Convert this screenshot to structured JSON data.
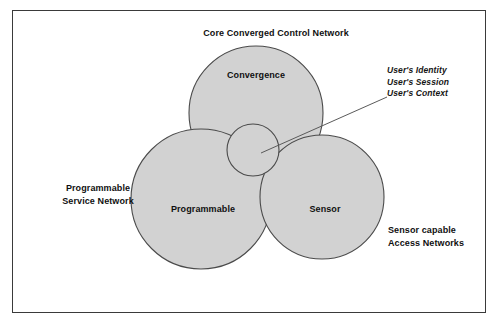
{
  "figure": {
    "frame_color": "#3a3a3a",
    "circle_fill": "#d2d2d2",
    "circle_stroke": "#4a4a4a",
    "background": "#ffffff"
  },
  "diagram": {
    "title_top": "Core Converged Control Network",
    "circles": [
      {
        "id": "convergence",
        "label": "Convergence",
        "cx": 256,
        "cy": 113,
        "r": 67
      },
      {
        "id": "programmable",
        "label": "Programmable",
        "cx": 201,
        "cy": 199,
        "r": 70
      },
      {
        "id": "sensor",
        "label": "Sensor",
        "cx": 322,
        "cy": 197,
        "r": 62
      }
    ],
    "center_circle": {
      "cx": 253,
      "cy": 150,
      "r": 26
    },
    "outer_labels": {
      "left": "Programmable\nService Network",
      "bottom_right": "Sensor capable\nAccess Networks"
    },
    "annotation": {
      "lines": "User's Identity\nUser's Session\nUser's Context",
      "leader_from": {
        "x": 261,
        "y": 153
      },
      "leader_to": {
        "x": 387,
        "y": 97
      }
    }
  },
  "caption": {
    "text": ""
  }
}
